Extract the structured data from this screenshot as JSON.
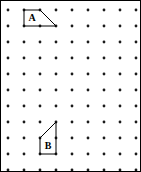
{
  "figure": {
    "width": 141,
    "height": 172,
    "background_color": "#ffffff",
    "border": {
      "visible": true,
      "color": "#000000",
      "width_px": 1
    }
  },
  "grid": {
    "type": "dot-lattice",
    "columns": 9,
    "rows": 11,
    "origin_x": 8,
    "origin_y": 10,
    "spacing_x": 16,
    "spacing_y": 16,
    "dot_radius": 1.4,
    "dot_color": "#1a1a1a"
  },
  "shapes": [
    {
      "id": "shape-a",
      "label": "A",
      "type": "trapezoid",
      "stroke_color": "#000000",
      "stroke_width": 1,
      "fill": "none",
      "points_px": "24,10 40,10 56,26 24,26",
      "vertices_grid": [
        [
          1,
          0
        ],
        [
          2,
          0
        ],
        [
          3,
          1
        ],
        [
          1,
          1
        ]
      ],
      "label_x": 32,
      "label_y": 18
    },
    {
      "id": "shape-b",
      "label": "B",
      "type": "trapezoid",
      "stroke_color": "#000000",
      "stroke_width": 1,
      "fill": "none",
      "points_px": "40,138 56,122 56,154 40,154",
      "vertices_grid": [
        [
          2,
          8
        ],
        [
          3,
          7
        ],
        [
          3,
          9
        ],
        [
          2,
          9
        ]
      ],
      "label_x": 48,
      "label_y": 146
    }
  ]
}
